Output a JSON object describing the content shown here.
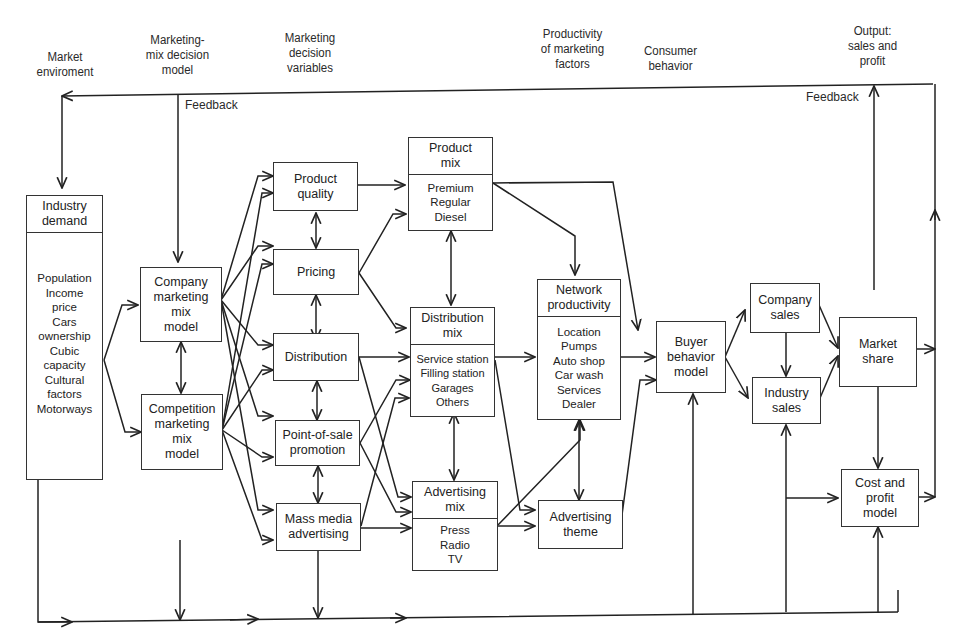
{
  "diagram": {
    "top_labels": {
      "market_environment": "Market\nenviroment",
      "marketing_mix_decision_model": "Marketing-\nmix decision\nmodel",
      "marketing_decision_variables": "Marketing\ndecision\nvariables",
      "productivity_of_marketing_factors": "Productivity\nof marketing\nfactors",
      "consumer_behavior": "Consumer\nbehavior",
      "output": "Output:\nsales and\nprofit"
    },
    "feedback_left": "Feedback",
    "feedback_right": "Feedback",
    "boxes": {
      "industry_demand": {
        "title": "Industry\ndemand",
        "items": "Population\nIncome\nprice\nCars\nownership\nCubic\ncapacity\nCultural\nfactors\nMotorways"
      },
      "company_mix": {
        "title": "Company\nmarketing\nmix\nmodel"
      },
      "competition_mix": {
        "title": "Competition\nmarketing\nmix\nmodel"
      },
      "product_quality": {
        "title": "Product\nquality"
      },
      "pricing": {
        "title": "Pricing"
      },
      "distribution": {
        "title": "Distribution"
      },
      "pos_promotion": {
        "title": "Point-of-sale\npromotion"
      },
      "mass_media": {
        "title": "Mass media\nadvertising"
      },
      "product_mix": {
        "title": "Product\nmix",
        "items": "Premium\nRegular\nDiesel"
      },
      "distribution_mix": {
        "title": "Distribution\nmix",
        "items": "Service station\nFilling station\nGarages\nOthers"
      },
      "advertising_mix": {
        "title": "Advertising\nmix",
        "items": "Press\nRadio\nTV"
      },
      "network_productivity": {
        "title": "Network\nproductivity",
        "items": "Location\nPumps\nAuto shop\nCar wash\nServices\nDealer"
      },
      "advertising_theme": {
        "title": "Advertising\ntheme"
      },
      "buyer_behavior": {
        "title": "Buyer\nbehavior\nmodel"
      },
      "company_sales": {
        "title": "Company\nsales"
      },
      "industry_sales": {
        "title": "Industry\nsales"
      },
      "market_share": {
        "title": "Market\nshare"
      },
      "cost_profit": {
        "title": "Cost and\nprofit\nmodel"
      }
    }
  }
}
